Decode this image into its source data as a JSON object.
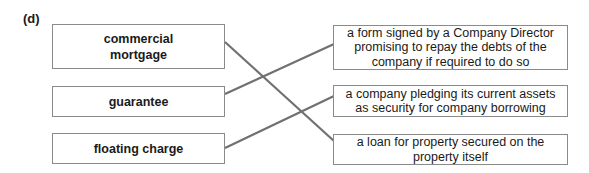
{
  "question_label": "(d)",
  "terms": [
    {
      "label": "commercial mortgage"
    },
    {
      "label": "guarantee"
    },
    {
      "label": "floating charge"
    }
  ],
  "definitions": [
    {
      "label": "a form signed by a Company Director promising to repay the debts of the company if required to do so"
    },
    {
      "label": "a company pledging its current assets as security for company borrowing"
    },
    {
      "label": "a loan for property secured on the property itself"
    }
  ],
  "matches": [
    {
      "term": "commercial mortgage",
      "definition": "a loan for property secured on the property itself"
    },
    {
      "term": "guarantee",
      "definition": "a form signed by a Company Director promising to repay the debts of the company if required to do so"
    },
    {
      "term": "floating charge",
      "definition": "a company pledging its current assets as security for company borrowing"
    }
  ],
  "colors": {
    "line": "#707070",
    "border": "#8a8a8a"
  }
}
